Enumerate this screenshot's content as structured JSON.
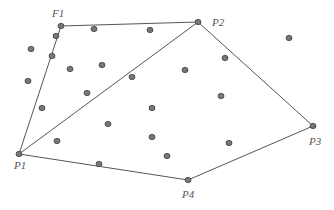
{
  "diagram": {
    "title": "",
    "colors": {
      "line": "#555555",
      "point_fill": "#777777",
      "point_stroke": "#444444",
      "label": "#555555"
    },
    "labeled_points": [
      {
        "id": "F1",
        "label": "F1",
        "x": 61,
        "y": 26,
        "lx": 52,
        "ly": 8
      },
      {
        "id": "P2",
        "label": "P2",
        "x": 198,
        "y": 22,
        "lx": 212,
        "ly": 17
      },
      {
        "id": "P3",
        "label": "P3",
        "x": 313,
        "y": 126,
        "lx": 309,
        "ly": 136
      },
      {
        "id": "P4",
        "label": "P4",
        "x": 188,
        "y": 180,
        "lx": 182,
        "ly": 189
      },
      {
        "id": "P1",
        "label": "P1",
        "x": 19,
        "y": 154,
        "lx": 14,
        "ly": 160
      }
    ],
    "edges": [
      [
        "F1",
        "P2"
      ],
      [
        "P2",
        "P3"
      ],
      [
        "P3",
        "P4"
      ],
      [
        "P4",
        "P1"
      ],
      [
        "P1",
        "F1"
      ],
      [
        "P1",
        "P2"
      ]
    ],
    "interior_points": [
      [
        56,
        36
      ],
      [
        94,
        29
      ],
      [
        150,
        30
      ],
      [
        31,
        49
      ],
      [
        52,
        56
      ],
      [
        70,
        69
      ],
      [
        102,
        65
      ],
      [
        28,
        81
      ],
      [
        132,
        77
      ],
      [
        87,
        93
      ],
      [
        289,
        38
      ],
      [
        225,
        58
      ],
      [
        185,
        70
      ],
      [
        221,
        96
      ],
      [
        42,
        108
      ],
      [
        152,
        108
      ],
      [
        108,
        124
      ],
      [
        57,
        141
      ],
      [
        152,
        137
      ],
      [
        99,
        164
      ],
      [
        229,
        143
      ],
      [
        167,
        156
      ]
    ]
  }
}
